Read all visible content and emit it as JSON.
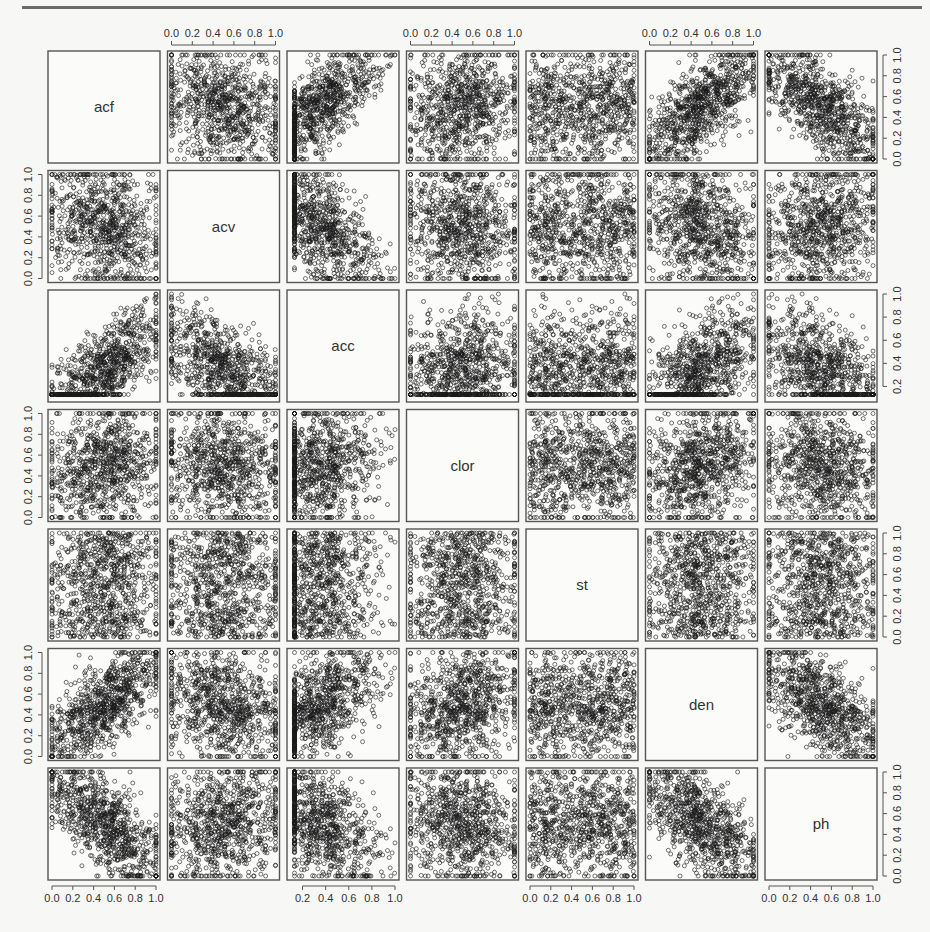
{
  "chart_data": {
    "type": "scatter",
    "subtype": "scatterplot-matrix",
    "title": "",
    "variables": [
      "acf",
      "acv",
      "acc",
      "clor",
      "st",
      "den",
      "ph"
    ],
    "axis_ranges": {
      "acf": [
        0.0,
        1.0
      ],
      "acv": [
        0.0,
        1.0
      ],
      "acc": [
        0.1,
        1.0
      ],
      "clor": [
        0.0,
        1.0
      ],
      "st": [
        0.0,
        1.0
      ],
      "den": [
        0.0,
        1.0
      ],
      "ph": [
        0.0,
        1.0
      ]
    },
    "tick_labels": {
      "acf": [
        "0.0",
        "0.2",
        "0.4",
        "0.6",
        "0.8",
        "1.0"
      ],
      "acv": [
        "0.0",
        "0.2",
        "0.4",
        "0.6",
        "0.8",
        "1.0"
      ],
      "acc": [
        "0.2",
        "0.4",
        "0.6",
        "0.8",
        "1.0"
      ],
      "clor": [
        "0.0",
        "0.2",
        "0.4",
        "0.6",
        "0.8",
        "1.0"
      ],
      "st": [
        "0.0",
        "0.2",
        "0.4",
        "0.6",
        "0.8",
        "1.0"
      ],
      "den": [
        "0.0",
        "0.2",
        "0.4",
        "0.6",
        "0.8",
        "1.0"
      ],
      "ph": [
        "0.0",
        "0.2",
        "0.4",
        "0.6",
        "0.8",
        "1.0"
      ]
    },
    "axis_placement": {
      "top": [
        "acv",
        "clor",
        "den"
      ],
      "bottom": [
        "acf",
        "acc",
        "st",
        "ph"
      ],
      "left": [
        "acv",
        "clor",
        "den"
      ],
      "right": [
        "acf",
        "acc",
        "st",
        "ph"
      ]
    },
    "pairwise_correlation_estimates": {
      "acf-acv": -0.2,
      "acf-acc": 0.6,
      "acf-clor": 0.1,
      "acf-st": 0.0,
      "acf-den": 0.6,
      "acf-ph": -0.65,
      "acv-acc": -0.5,
      "acv-clor": 0.05,
      "acv-st": 0.0,
      "acv-den": 0.0,
      "acv-ph": 0.1,
      "acc-clor": 0.1,
      "acc-st": 0.05,
      "acc-den": 0.2,
      "acc-ph": -0.45,
      "clor-st": 0.1,
      "clor-den": 0.3,
      "clor-ph": -0.15,
      "st-den": 0.0,
      "st-ph": 0.0,
      "den-ph": -0.2
    },
    "n_points_per_panel_approx": 1500,
    "marker": "open circle",
    "grid": false,
    "legend": null
  },
  "style": {
    "panel_border": "#555555",
    "point_color": "#1a1a1a",
    "text_color": "#333333",
    "background": "#f7f7f5"
  }
}
